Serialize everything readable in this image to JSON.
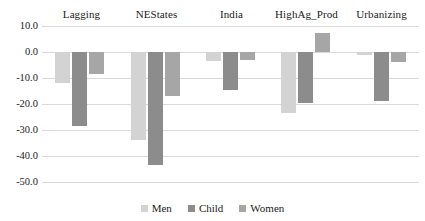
{
  "chart_data": {
    "type": "bar",
    "title": "",
    "xlabel": "",
    "ylabel": "",
    "categories": [
      "Lagging",
      "NEStates",
      "India",
      "HighAg_Prod",
      "Urbanizing"
    ],
    "series": [
      {
        "name": "Men",
        "color": "#d3d3d3",
        "values": [
          -12.0,
          -34.0,
          -3.5,
          -23.5,
          -1.0
        ]
      },
      {
        "name": "Child",
        "color": "#8c8c8c",
        "values": [
          -28.5,
          -43.5,
          -14.5,
          -19.5,
          -19.0
        ]
      },
      {
        "name": "Women",
        "color": "#a6a6a6",
        "values": [
          -8.5,
          -17.0,
          -3.0,
          7.5,
          -4.0
        ]
      }
    ],
    "ylim": [
      -50.0,
      10.0
    ],
    "ytick_labels": [
      "10.0",
      "0.0",
      "-10.0",
      "-20.0",
      "-30.0",
      "-40.0",
      "-50.0"
    ],
    "ytick_values": [
      10.0,
      0.0,
      -10.0,
      -20.0,
      -30.0,
      -40.0,
      -50.0
    ],
    "grid": true,
    "legend_position": "bottom",
    "category_label_position": "top",
    "gridline_color": "#d9d9d9"
  }
}
